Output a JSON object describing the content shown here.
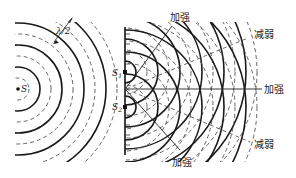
{
  "diagram": {
    "source_label": "S",
    "slit1_label": "S",
    "slit1_sub": "1",
    "slit2_label": "S",
    "slit2_sub": "2",
    "wavelength_label": "λ/2",
    "labels": {
      "constructive_top": "加强",
      "constructive_center": "加强",
      "constructive_bottom": "加强",
      "destructive_top": "减弱",
      "destructive_bottom": "减弱"
    },
    "legend": {
      "solid_line": "wave crest",
      "dashed_line": "wave trough"
    },
    "colors": {
      "line": "#1a1a1a",
      "dashed": "#555555",
      "background": "#ffffff"
    }
  }
}
